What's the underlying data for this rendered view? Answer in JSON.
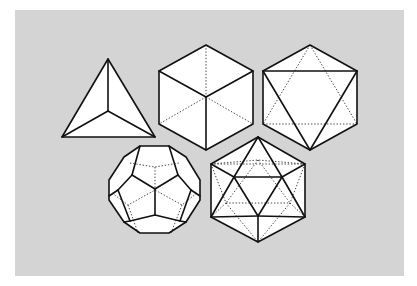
{
  "figure": {
    "background_color": "#d4d4d4",
    "solids": [
      {
        "name": "Tetrahedron"
      },
      {
        "name": "Cube"
      },
      {
        "name": "Octahedron"
      },
      {
        "name": "Dodecahedron"
      },
      {
        "name": "Icosahedron"
      }
    ]
  }
}
